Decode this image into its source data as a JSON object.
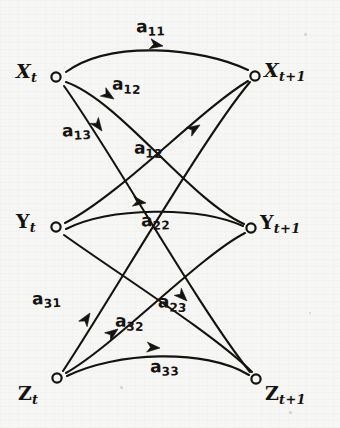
{
  "figure": {
    "kind": "hand-drawn-signal-flow-graph",
    "background_color": "#f6f6f4",
    "ink_color": "#15130f",
    "width": 340,
    "height": 428
  },
  "nodes": [
    {
      "id": "x_t",
      "base": "X",
      "sub": "t",
      "cx": 56,
      "cy": 77,
      "label_x": 16,
      "label_y": 60,
      "side": "left",
      "row": "x"
    },
    {
      "id": "x_t1",
      "base": "X",
      "sub": "t+1",
      "cx": 255,
      "cy": 76,
      "label_x": 264,
      "label_y": 59,
      "side": "right",
      "row": "x"
    },
    {
      "id": "y_t",
      "base": "Y",
      "sub": "t",
      "cx": 56,
      "cy": 227,
      "label_x": 16,
      "label_y": 210,
      "side": "left",
      "row": "y"
    },
    {
      "id": "y_t1",
      "base": "Y",
      "sub": "t+1",
      "cx": 251,
      "cy": 228,
      "label_x": 260,
      "label_y": 211,
      "side": "right",
      "row": "y"
    },
    {
      "id": "z_t",
      "base": "Z",
      "sub": "t",
      "cx": 57,
      "cy": 378,
      "label_x": 18,
      "label_y": 382,
      "side": "left",
      "row": "z"
    },
    {
      "id": "z_t1",
      "base": "Z",
      "sub": "t+1",
      "cx": 256,
      "cy": 379,
      "label_x": 265,
      "label_y": 382,
      "side": "right",
      "row": "z"
    }
  ],
  "edges": [
    {
      "id": "e-a11",
      "from": "x_t",
      "to": "x_t1",
      "coefficient": "a",
      "sub": "11",
      "path": "M 66 72 C 110 40, 200 47, 248 70",
      "arrow": {
        "x": 163,
        "y": 46,
        "angle": 10
      },
      "label_x": 136,
      "label_y": 16,
      "rot": "rot-1"
    },
    {
      "id": "e-a12-upper",
      "from": "x_t",
      "to": "y_t1",
      "coefficient": "a",
      "sub": "12",
      "path": "M 66 82 C 120 101, 190 200, 244 224",
      "arrow": {
        "x": 114,
        "y": 99,
        "angle": 33
      },
      "label_x": 112,
      "label_y": 74,
      "rot": "rot-2"
    },
    {
      "id": "e-a13",
      "from": "x_t",
      "to": "z_t1",
      "coefficient": "a",
      "sub": "13",
      "path": "M 64 86 C 110 150, 200 310, 250 372",
      "arrow": {
        "x": 102,
        "y": 131,
        "angle": 54
      },
      "label_x": 62,
      "label_y": 120,
      "rot": "rot-3"
    },
    {
      "id": "e-a12-lower",
      "from": "y_t",
      "to": "x_t1",
      "coefficient": "a",
      "sub": "12",
      "path": "M 65 223 C 120 195, 200 110, 248 81",
      "arrow": {
        "x": 200,
        "y": 125,
        "angle": -32
      },
      "label_x": 134,
      "label_y": 138,
      "rot": "rot-2"
    },
    {
      "id": "e-a22",
      "from": "y_t",
      "to": "y_t1",
      "coefficient": "a",
      "sub": "22",
      "path": "M 66 229 C 110 207, 198 206, 243 226",
      "arrow": {
        "x": 146,
        "y": 203,
        "angle": 8
      },
      "label_x": 141,
      "label_y": 210,
      "rot": "rot-1"
    },
    {
      "id": "e-a23",
      "from": "y_t",
      "to": "z_t1",
      "coefficient": "a",
      "sub": "23",
      "path": "M 64 235 C 120 275, 215 335, 252 372",
      "arrow": {
        "x": 187,
        "y": 301,
        "angle": 45
      },
      "label_x": 158,
      "label_y": 292,
      "rot": "rot-4"
    },
    {
      "id": "e-a31",
      "from": "z_t",
      "to": "x_t1",
      "coefficient": "a",
      "sub": "31",
      "path": "M 63 371 C 110 300, 205 135, 250 82",
      "arrow": {
        "x": 90,
        "y": 313,
        "angle": -57
      },
      "label_x": 32,
      "label_y": 288,
      "rot": "rot-3"
    },
    {
      "id": "e-a32",
      "from": "z_t",
      "to": "y_t1",
      "coefficient": "a",
      "sub": "32",
      "path": "M 66 373 C 115 345, 200 256, 245 233",
      "arrow": {
        "x": 118,
        "y": 329,
        "angle": -37
      },
      "label_x": 115,
      "label_y": 311,
      "rot": "rot-2"
    },
    {
      "id": "e-a33",
      "from": "z_t",
      "to": "z_t1",
      "coefficient": "a",
      "sub": "33",
      "path": "M 67 376 C 115 352, 205 348, 249 375",
      "arrow": {
        "x": 160,
        "y": 348,
        "angle": 4
      },
      "label_x": 150,
      "label_y": 356,
      "rot": "rot-1"
    }
  ],
  "specks": [
    {
      "x": 304,
      "y": 33,
      "size": 3
    },
    {
      "x": 120,
      "y": 386,
      "size": 3
    },
    {
      "x": 289,
      "y": 411,
      "size": 3
    },
    {
      "x": 309,
      "y": 312,
      "size": 2
    }
  ]
}
